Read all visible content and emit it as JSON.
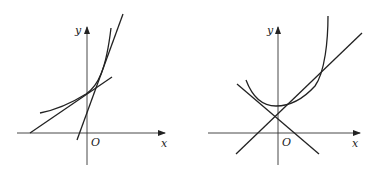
{
  "figures": [
    {
      "id": "left",
      "x_label": "x",
      "y_label": "y",
      "origin_label": "O",
      "description": "Exponential-like convex curve with two lines: one tangent-like shallow line crossing the curve, one steep line crossing it"
    },
    {
      "id": "right",
      "x_label": "x",
      "y_label": "y",
      "origin_label": "O",
      "description": "U-shaped convex curve with a tangent line of positive slope and a line of negative slope, intersecting near the y-axis"
    }
  ]
}
